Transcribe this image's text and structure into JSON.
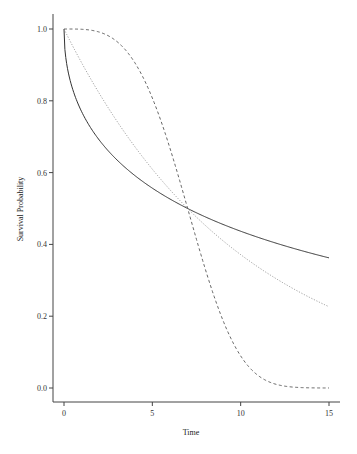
{
  "chart_data": {
    "type": "line",
    "title": "",
    "xlabel": "Time",
    "ylabel": "Survival Probability",
    "xlim": [
      0,
      15
    ],
    "ylim": [
      0,
      1
    ],
    "xticks": [
      0,
      5,
      10,
      15
    ],
    "xtick_labels": [
      "0",
      "5",
      "10",
      "15"
    ],
    "yticks": [
      0,
      0.2,
      0.4,
      0.6,
      0.8,
      1.0
    ],
    "ytick_labels": [
      "0.0",
      "0.2",
      "0.4",
      "0.6",
      "0.8",
      "1.0"
    ],
    "grid": false,
    "legend": null,
    "series": [
      {
        "name": "solid (Weibull, shape 0.5)",
        "style": "solid",
        "color": "#333333",
        "x": [
          0,
          1,
          2,
          3,
          4,
          5,
          6,
          7,
          8,
          9,
          10,
          11,
          12,
          13,
          14,
          15
        ],
        "values": [
          1.0,
          0.77,
          0.69,
          0.64,
          0.59,
          0.56,
          0.53,
          0.5,
          0.48,
          0.46,
          0.44,
          0.42,
          0.4,
          0.39,
          0.37,
          0.36
        ]
      },
      {
        "name": "dotted (Exponential)",
        "style": "dotted",
        "color": "#888888",
        "x": [
          0,
          1,
          2,
          3,
          4,
          5,
          6,
          7,
          8,
          9,
          10,
          11,
          12,
          13,
          14,
          15
        ],
        "values": [
          1.0,
          0.91,
          0.82,
          0.74,
          0.67,
          0.61,
          0.55,
          0.5,
          0.45,
          0.41,
          0.37,
          0.34,
          0.3,
          0.28,
          0.25,
          0.23
        ]
      },
      {
        "name": "dashed (Weibull, shape 3.5)",
        "style": "dashed",
        "color": "#555555",
        "x": [
          0,
          1,
          2,
          3,
          4,
          5,
          6,
          7,
          8,
          9,
          10,
          11,
          12,
          13,
          14,
          15
        ],
        "values": [
          1.0,
          1.0,
          0.99,
          0.96,
          0.89,
          0.81,
          0.66,
          0.5,
          0.35,
          0.21,
          0.1,
          0.05,
          0.02,
          0.005,
          0.001,
          0.0
        ]
      }
    ]
  }
}
